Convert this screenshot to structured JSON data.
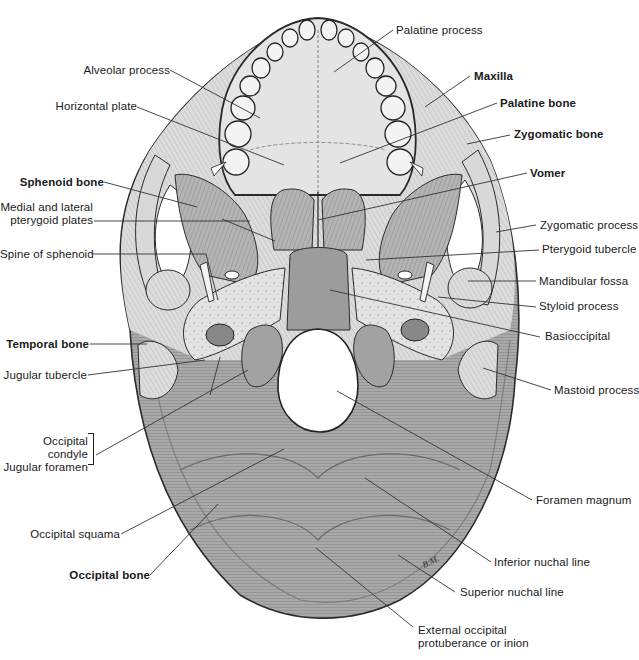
{
  "figure": {
    "artist_initials": "B.M."
  },
  "labels": {
    "palatine_process": "Palatine process",
    "alveolar_process": "Alveolar process",
    "maxilla": "Maxilla",
    "horizontal_plate": "Horizontal plate",
    "palatine_bone": "Palatine bone",
    "zygomatic_bone": "Zygomatic bone",
    "sphenoid_bone": "Sphenoid bone",
    "vomer": "Vomer",
    "pterygoid_plates_line1": "Medial and lateral",
    "pterygoid_plates_line2": "pterygoid plates",
    "zygomatic_process": "Zygomatic process",
    "spine_of_sphenoid": "Spine of sphenoid",
    "pterygoid_tubercle": "Pterygoid tubercle",
    "mandibular_fossa": "Mandibular fossa",
    "styloid_process": "Styloid process",
    "temporal_bone": "Temporal bone",
    "basioccipital": "Basioccipital",
    "jugular_tubercle": "Jugular tubercle",
    "mastoid_process": "Mastoid process",
    "occipital_condyle": "Occipital condyle",
    "jugular_foramen": "Jugular foramen",
    "foramen_magnum": "Foramen magnum",
    "occipital_squama": "Occipital squama",
    "inferior_nuchal_line": "Inferior nuchal line",
    "occipital_bone": "Occipital bone",
    "superior_nuchal_line": "Superior nuchal line",
    "external_occipital_line1": "External occipital",
    "external_occipital_line2": "protuberance or inion"
  },
  "colors": {
    "bone_light": "#e6e6e6",
    "bone_mid": "#bdbdbd",
    "bone_dark": "#8f8f8f",
    "outline": "#2a2a2a",
    "text": "#1a1a1a",
    "leader": "#333333"
  }
}
